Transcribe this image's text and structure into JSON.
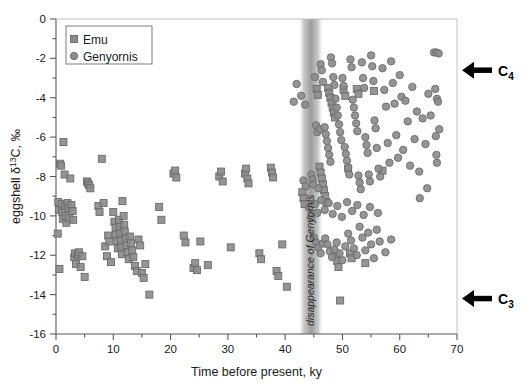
{
  "figure": {
    "background_color": "#ffffff",
    "marker_fill": "#8c8c8c",
    "marker_stroke": "#6b6b6b",
    "axis_color": "#5a5a5a"
  },
  "legend": {
    "position": "top-left inside axes",
    "entries": [
      {
        "label": "Emu",
        "marker": "square",
        "marker_name": "legend-marker-square-emu"
      },
      {
        "label": "Genyornis",
        "marker": "circle",
        "marker_name": "legend-marker-circle-genyornis"
      }
    ]
  },
  "annotations": {
    "band_label": "disappearance of Genyornis",
    "band_center_ky": 44.5,
    "arrow_c4": {
      "label": "C",
      "subscript": "4",
      "y_value": -2.6
    },
    "arrow_c3": {
      "label": "C",
      "subscript": "3",
      "y_value": -14.2
    }
  },
  "chart_data": {
    "type": "scatter",
    "title": "",
    "xlabel": "Time before present, ky",
    "ylabel": "eggshell δ13C, ‰",
    "ylabel_parts": {
      "prefix": "eggshell δ",
      "superscript": "13",
      "suffix": "C, ‰"
    },
    "xlim": [
      0,
      70
    ],
    "ylim": [
      -16,
      0
    ],
    "xticks": [
      0,
      10,
      20,
      30,
      40,
      50,
      60,
      70
    ],
    "yticks": [
      0,
      -2,
      -4,
      -6,
      -8,
      -10,
      -12,
      -14,
      -16
    ],
    "xtick_labels": [
      "0",
      "10",
      "20",
      "30",
      "40",
      "50",
      "60",
      "70"
    ],
    "ytick_labels": [
      "0",
      "-2",
      "-4",
      "-6",
      "-8",
      "-10",
      "-12",
      "-14",
      "-16"
    ],
    "xminor_step": 5,
    "yminor_step": 1,
    "grid": false,
    "legend_position": "upper left",
    "series": [
      {
        "name": "Emu",
        "marker": "square",
        "color": "#8c8c8c",
        "points": [
          [
            0.3,
            -10.9
          ],
          [
            0.4,
            -9.3
          ],
          [
            0.5,
            -9.7
          ],
          [
            0.6,
            -12.7
          ],
          [
            0.7,
            -7.35
          ],
          [
            0.9,
            -7.45
          ],
          [
            1.0,
            -9.4
          ],
          [
            1.1,
            -9.8
          ],
          [
            1.2,
            -10.15
          ],
          [
            1.3,
            -6.25
          ],
          [
            1.5,
            -7.9
          ],
          [
            1.6,
            -9.5
          ],
          [
            1.7,
            -10.0
          ],
          [
            1.8,
            -10.35
          ],
          [
            2.0,
            -9.35
          ],
          [
            2.2,
            -9.6
          ],
          [
            2.3,
            -10.1
          ],
          [
            2.5,
            -8.1
          ],
          [
            2.7,
            -9.45
          ],
          [
            2.9,
            -9.75
          ],
          [
            3.0,
            -10.2
          ],
          [
            3.2,
            -12.1
          ],
          [
            3.3,
            -11.9
          ],
          [
            3.5,
            -12.45
          ],
          [
            3.8,
            -12.0
          ],
          [
            4.0,
            -11.85
          ],
          [
            4.3,
            -12.6
          ],
          [
            4.6,
            -12.05
          ],
          [
            5.0,
            -13.1
          ],
          [
            5.4,
            -8.25
          ],
          [
            5.6,
            -8.35
          ],
          [
            5.8,
            -8.45
          ],
          [
            6.0,
            -8.6
          ],
          [
            7.4,
            -9.5
          ],
          [
            7.6,
            -9.8
          ],
          [
            8.0,
            -7.1
          ],
          [
            8.3,
            -9.35
          ],
          [
            8.6,
            -11.55
          ],
          [
            8.9,
            -12.05
          ],
          [
            9.1,
            -11.0
          ],
          [
            9.3,
            -11.3
          ],
          [
            9.6,
            -12.35
          ],
          [
            10.0,
            -9.8
          ],
          [
            10.2,
            -10.3
          ],
          [
            10.4,
            -10.6
          ],
          [
            10.5,
            -10.95
          ],
          [
            10.7,
            -11.3
          ],
          [
            10.8,
            -11.65
          ],
          [
            11.0,
            -10.2
          ],
          [
            11.1,
            -10.55
          ],
          [
            11.2,
            -10.9
          ],
          [
            11.3,
            -11.25
          ],
          [
            11.4,
            -11.6
          ],
          [
            11.5,
            -11.95
          ],
          [
            11.6,
            -9.25
          ],
          [
            11.8,
            -10.0
          ],
          [
            11.9,
            -10.45
          ],
          [
            12.0,
            -10.8
          ],
          [
            12.2,
            -11.15
          ],
          [
            12.3,
            -11.5
          ],
          [
            12.5,
            -11.85
          ],
          [
            12.7,
            -12.2
          ],
          [
            12.9,
            -11.05
          ],
          [
            13.1,
            -11.4
          ],
          [
            13.3,
            -11.75
          ],
          [
            13.5,
            -12.1
          ],
          [
            13.8,
            -12.55
          ],
          [
            14.1,
            -12.8
          ],
          [
            14.4,
            -11.2
          ],
          [
            14.7,
            -11.5
          ],
          [
            15.0,
            -12.9
          ],
          [
            15.3,
            -13.15
          ],
          [
            15.6,
            -12.45
          ],
          [
            16.3,
            -14.0
          ],
          [
            18.0,
            -9.55
          ],
          [
            18.4,
            -10.2
          ],
          [
            20.5,
            -7.85
          ],
          [
            20.8,
            -7.7
          ],
          [
            21.0,
            -8.05
          ],
          [
            22.3,
            -11.0
          ],
          [
            22.6,
            -11.35
          ],
          [
            24.0,
            -12.65
          ],
          [
            24.3,
            -12.4
          ],
          [
            24.6,
            -12.75
          ],
          [
            25.2,
            -11.3
          ],
          [
            26.5,
            -12.5
          ],
          [
            28.5,
            -8.0
          ],
          [
            28.8,
            -7.75
          ],
          [
            29.1,
            -8.25
          ],
          [
            30.5,
            -11.6
          ],
          [
            33.0,
            -7.85
          ],
          [
            33.2,
            -7.6
          ],
          [
            33.4,
            -8.1
          ],
          [
            33.6,
            -8.35
          ],
          [
            35.5,
            -11.9
          ],
          [
            35.8,
            -12.2
          ],
          [
            37.5,
            -7.55
          ],
          [
            37.7,
            -7.8
          ],
          [
            37.9,
            -8.05
          ],
          [
            38.5,
            -12.8
          ],
          [
            38.8,
            -13.05
          ],
          [
            39.5,
            -11.45
          ],
          [
            40.3,
            -13.6
          ],
          [
            43.0,
            -8.8
          ],
          [
            43.2,
            -9.1
          ],
          [
            43.4,
            -9.4
          ],
          [
            45.5,
            -3.55
          ],
          [
            45.7,
            -3.85
          ],
          [
            46.0,
            -7.5
          ],
          [
            46.2,
            -7.8
          ],
          [
            46.4,
            -8.1
          ],
          [
            46.6,
            -8.4
          ],
          [
            46.8,
            -8.7
          ],
          [
            47.0,
            -9.0
          ],
          [
            47.2,
            -9.3
          ],
          [
            47.5,
            -3.5
          ],
          [
            47.7,
            -3.75
          ],
          [
            47.9,
            -4.0
          ],
          [
            48.1,
            -4.25
          ],
          [
            48.3,
            -4.5
          ],
          [
            48.5,
            -4.75
          ],
          [
            48.7,
            -5.0
          ],
          [
            48.9,
            -12.0
          ],
          [
            49.1,
            -12.3
          ],
          [
            49.3,
            -12.6
          ],
          [
            49.6,
            -14.3
          ],
          [
            50.2,
            -3.6
          ],
          [
            50.5,
            -3.9
          ],
          [
            51.0,
            -7.6
          ],
          [
            51.3,
            -11.9
          ],
          [
            51.6,
            -12.15
          ],
          [
            52.5,
            -3.55
          ],
          [
            52.8,
            -3.8
          ],
          [
            54.0,
            -12.4
          ],
          [
            55.5,
            -3.65
          ],
          [
            57.0,
            -7.7
          ]
        ]
      },
      {
        "name": "Genyornis",
        "marker": "circle",
        "color": "#8c8c8c",
        "points": [
          [
            41.5,
            -4.2
          ],
          [
            42.0,
            -3.3
          ],
          [
            44.6,
            -7.9
          ],
          [
            44.8,
            -8.15
          ],
          [
            44.9,
            -8.4
          ],
          [
            45.2,
            -2.95
          ],
          [
            45.4,
            -5.4
          ],
          [
            45.6,
            -5.75
          ],
          [
            45.8,
            -8.6
          ],
          [
            46.0,
            -5.6
          ],
          [
            46.2,
            -2.3
          ],
          [
            46.4,
            -2.6
          ],
          [
            46.6,
            -3.2
          ],
          [
            46.9,
            -5.5
          ],
          [
            47.1,
            -5.85
          ],
          [
            47.3,
            -6.2
          ],
          [
            47.5,
            -6.55
          ],
          [
            47.7,
            -6.9
          ],
          [
            47.9,
            -7.25
          ],
          [
            48.0,
            -1.95
          ],
          [
            48.2,
            -2.25
          ],
          [
            48.4,
            -2.95
          ],
          [
            48.6,
            -3.35
          ],
          [
            48.8,
            -4.05
          ],
          [
            49.0,
            -4.5
          ],
          [
            49.2,
            -4.9
          ],
          [
            49.4,
            -5.35
          ],
          [
            49.6,
            -5.75
          ],
          [
            49.8,
            -6.15
          ],
          [
            50.0,
            -3.0
          ],
          [
            50.2,
            -3.4
          ],
          [
            50.4,
            -6.5
          ],
          [
            50.6,
            -6.85
          ],
          [
            50.8,
            -7.2
          ],
          [
            51.0,
            -7.55
          ],
          [
            51.2,
            -7.9
          ],
          [
            51.4,
            -2.05
          ],
          [
            51.6,
            -2.45
          ],
          [
            51.8,
            -4.1
          ],
          [
            52.0,
            -4.5
          ],
          [
            52.2,
            -4.9
          ],
          [
            52.4,
            -5.3
          ],
          [
            52.6,
            -5.7
          ],
          [
            52.8,
            -7.95
          ],
          [
            53.0,
            -8.3
          ],
          [
            53.2,
            -8.65
          ],
          [
            53.4,
            -2.2
          ],
          [
            53.6,
            -3.0
          ],
          [
            53.8,
            -3.5
          ],
          [
            54.0,
            -6.0
          ],
          [
            54.2,
            -6.4
          ],
          [
            54.4,
            -6.8
          ],
          [
            54.6,
            -7.9
          ],
          [
            54.8,
            -8.25
          ],
          [
            55.0,
            -1.85
          ],
          [
            55.2,
            -2.4
          ],
          [
            55.4,
            -3.15
          ],
          [
            55.6,
            -5.15
          ],
          [
            55.8,
            -5.55
          ],
          [
            56.0,
            -6.55
          ],
          [
            56.3,
            -7.6
          ],
          [
            56.6,
            -8.0
          ],
          [
            57.0,
            -2.5
          ],
          [
            57.3,
            -3.6
          ],
          [
            57.6,
            -4.45
          ],
          [
            57.9,
            -6.3
          ],
          [
            58.2,
            -7.3
          ],
          [
            58.5,
            -2.15
          ],
          [
            58.8,
            -3.25
          ],
          [
            59.1,
            -4.3
          ],
          [
            59.4,
            -5.9
          ],
          [
            59.7,
            -7.05
          ],
          [
            60.0,
            -2.85
          ],
          [
            60.3,
            -3.95
          ],
          [
            60.6,
            -6.65
          ],
          [
            61.0,
            -4.15
          ],
          [
            61.4,
            -5.2
          ],
          [
            61.8,
            -7.45
          ],
          [
            62.2,
            -3.45
          ],
          [
            62.6,
            -6.1
          ],
          [
            63.0,
            -4.7
          ],
          [
            63.4,
            -7.75
          ],
          [
            64.0,
            -5.05
          ],
          [
            64.5,
            -6.35
          ],
          [
            65.0,
            -3.8
          ],
          [
            65.4,
            -4.9
          ],
          [
            66.0,
            -1.7
          ],
          [
            66.4,
            -1.7
          ],
          [
            66.8,
            -1.75
          ],
          [
            66.2,
            -3.55
          ],
          [
            66.5,
            -4.05
          ],
          [
            66.7,
            -4.2
          ],
          [
            66.3,
            -5.95
          ],
          [
            66.9,
            -5.6
          ],
          [
            66.4,
            -6.9
          ],
          [
            66.5,
            -7.3
          ],
          [
            64.8,
            -8.6
          ],
          [
            63.5,
            -9.1
          ],
          [
            43.2,
            -8.2
          ],
          [
            43.6,
            -8.5
          ],
          [
            45.0,
            -11.1
          ],
          [
            45.4,
            -11.35
          ],
          [
            45.8,
            -11.6
          ],
          [
            46.2,
            -11.9
          ],
          [
            46.6,
            -11.4
          ],
          [
            47.0,
            -11.15
          ],
          [
            47.4,
            -11.45
          ],
          [
            47.8,
            -11.8
          ],
          [
            48.2,
            -12.1
          ],
          [
            48.6,
            -11.7
          ],
          [
            49.0,
            -11.35
          ],
          [
            49.5,
            -11.9
          ],
          [
            50.0,
            -12.25
          ],
          [
            50.5,
            -11.55
          ],
          [
            51.0,
            -10.9
          ],
          [
            51.5,
            -11.25
          ],
          [
            52.0,
            -11.65
          ],
          [
            52.5,
            -12.0
          ],
          [
            53.0,
            -10.55
          ],
          [
            53.5,
            -11.1
          ],
          [
            54.0,
            -11.75
          ],
          [
            54.5,
            -10.85
          ],
          [
            55.0,
            -11.45
          ],
          [
            55.5,
            -12.15
          ],
          [
            56.0,
            -10.7
          ],
          [
            56.5,
            -11.3
          ],
          [
            57.5,
            -11.85
          ],
          [
            58.5,
            -11.2
          ],
          [
            44.2,
            -9.6
          ],
          [
            44.5,
            -10.1
          ],
          [
            45.2,
            -9.4
          ],
          [
            45.6,
            -9.85
          ],
          [
            46.3,
            -9.2
          ],
          [
            46.9,
            -9.7
          ],
          [
            47.6,
            -9.35
          ],
          [
            48.3,
            -9.9
          ],
          [
            49.1,
            -9.5
          ],
          [
            49.9,
            -10.05
          ],
          [
            50.8,
            -9.3
          ],
          [
            51.7,
            -9.75
          ],
          [
            52.6,
            -9.45
          ],
          [
            53.7,
            -9.95
          ],
          [
            54.8,
            -9.55
          ],
          [
            56.2,
            -9.85
          ],
          [
            42.8,
            -3.9
          ],
          [
            43.5,
            -4.35
          ]
        ]
      }
    ]
  }
}
